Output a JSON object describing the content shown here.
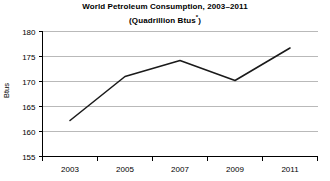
{
  "chart_data": {
    "type": "line",
    "title": "World Petroleum Consumption, 2003–2011",
    "subtitle": "(Quadrillion Btus*)",
    "subtitle_text": "(Quadrillion Btus",
    "subtitle_footnote_mark": "*",
    "subtitle_close": ")",
    "xlabel": "",
    "ylabel": "Btus",
    "categories": [
      "2003",
      "2005",
      "2007",
      "2009",
      "2011"
    ],
    "x": [
      2003,
      2005,
      2007,
      2009,
      2011
    ],
    "values": [
      162.2,
      171.0,
      174.2,
      170.2,
      176.7
    ],
    "series": [
      {
        "name": "World Petroleum Consumption",
        "values": [
          162.2,
          171.0,
          174.2,
          170.2,
          176.7
        ]
      }
    ],
    "ylim": [
      155,
      180
    ],
    "yticks": [
      155,
      160,
      165,
      170,
      175,
      180
    ],
    "ytick_labels": [
      "155",
      "160",
      "165",
      "170",
      "175",
      "180"
    ],
    "xtick_labels": [
      "2003",
      "2005",
      "2007",
      "2009",
      "2011"
    ],
    "grid": true,
    "grid_axis": "y",
    "legend": false,
    "legend_position": "none",
    "line_color": "#1a1a1a",
    "grid_color": "#b9b9b9",
    "axis_color": "#000000",
    "background_color": "#ffffff"
  }
}
